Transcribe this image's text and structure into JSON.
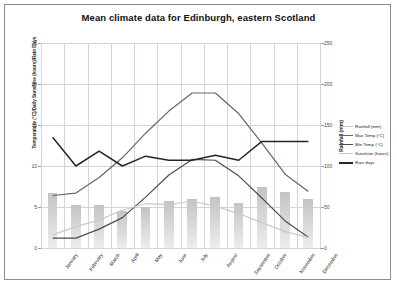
{
  "chart_data": {
    "type": "line",
    "title": "Mean climate data for Edinburgh, eastern Scotland",
    "categories": [
      "January",
      "February",
      "March",
      "April",
      "May",
      "June",
      "July",
      "August",
      "September",
      "October",
      "November",
      "December"
    ],
    "xlabel": "",
    "ylabel_left": "Temperature (°C)/Daily Sunshine (hours)/Rain Days",
    "ylabel_right": "Rainfall (mm)",
    "ylim_left": [
      0,
      25
    ],
    "ylim_right": [
      0,
      250
    ],
    "yticks_left": [
      "0",
      "5",
      "10",
      "15",
      "20",
      "25"
    ],
    "yticks_right": [
      "0",
      "50",
      "100",
      "150",
      "200",
      "250"
    ],
    "grid": true,
    "legend_position": "right",
    "series": [
      {
        "name": "Rainfall (mm)",
        "type": "bar",
        "axis": "right",
        "color": "#c8c8c8",
        "values": [
          67,
          52,
          52,
          45,
          50,
          57,
          60,
          62,
          55,
          75,
          68,
          60
        ]
      },
      {
        "name": "Max Temp (°C)",
        "type": "line",
        "axis": "left",
        "color": "#666666",
        "values": [
          6.4,
          6.7,
          8.6,
          11.0,
          14.0,
          16.7,
          18.9,
          18.9,
          16.4,
          12.8,
          9.0,
          6.9
        ]
      },
      {
        "name": "Min Temp (°C)",
        "type": "line",
        "axis": "left",
        "color": "#4d4d4d",
        "values": [
          1.2,
          1.2,
          2.3,
          3.7,
          6.2,
          8.9,
          10.8,
          10.7,
          8.8,
          6.1,
          3.3,
          1.3
        ]
      },
      {
        "name": "Sunshine (hours)",
        "type": "line",
        "axis": "left",
        "color": "#c9c9c9",
        "values": [
          1.6,
          2.6,
          3.4,
          4.6,
          5.4,
          5.3,
          5.7,
          5.1,
          4.2,
          3.1,
          2.0,
          1.3
        ]
      },
      {
        "name": "Rain days",
        "type": "line",
        "axis": "left",
        "color": "#262626",
        "values": [
          13.5,
          10.0,
          11.8,
          10.0,
          11.2,
          10.7,
          10.7,
          11.3,
          10.7,
          13.0,
          13.0,
          13.0
        ]
      }
    ]
  }
}
